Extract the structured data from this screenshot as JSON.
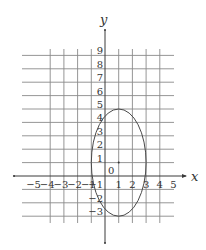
{
  "chart_data": {
    "type": "line",
    "title": "",
    "xlabel": "x",
    "ylabel": "y",
    "xlim": [
      -6,
      6
    ],
    "ylim": [
      -4,
      10
    ],
    "grid": true,
    "x_ticks": [
      -5,
      -4,
      -3,
      -2,
      -1,
      1,
      2,
      3,
      4,
      5
    ],
    "y_ticks": [
      -3,
      -2,
      -1,
      1,
      2,
      3,
      4,
      5,
      6,
      7,
      8,
      9
    ],
    "origin_label": "0",
    "series": [
      {
        "name": "ellipse",
        "shape": "ellipse",
        "center": [
          1,
          1
        ],
        "radius_x": 2,
        "radius_y": 4,
        "x_range": [
          -1,
          3
        ],
        "y_range": [
          -3,
          5
        ],
        "color": "#4a4a4a"
      },
      {
        "name": "center-point",
        "shape": "point",
        "x": 1,
        "y": 1
      }
    ]
  },
  "axes": {
    "x_label": "x",
    "y_label": "y",
    "origin": "0",
    "x_tick_labels": [
      "−5",
      "−4",
      "−3",
      "−2",
      "−1",
      "1",
      "2",
      "3",
      "4",
      "5"
    ],
    "y_tick_labels": [
      "9",
      "8",
      "7",
      "6",
      "5",
      "4",
      "3",
      "2",
      "1",
      "−1",
      "−2",
      "−3"
    ]
  },
  "colors": {
    "grid": "#8a8a8a",
    "axis": "#3a3a3a",
    "curve": "#4a4a4a",
    "text": "#333333"
  }
}
